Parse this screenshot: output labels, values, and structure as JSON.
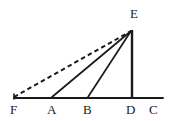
{
  "figure": {
    "background_color": "#ffffff",
    "stroke_color": "#1a1a1a",
    "label_color": "#1a1a1a",
    "width": 169,
    "height": 121
  },
  "points": {
    "F": {
      "label": "F",
      "x": 14,
      "y": 98,
      "label_x": 10,
      "label_y": 104
    },
    "A": {
      "label": "A",
      "x": 52,
      "y": 98,
      "label_x": 47,
      "label_y": 104
    },
    "B": {
      "label": "B",
      "x": 88,
      "y": 98,
      "label_x": 83,
      "label_y": 104
    },
    "D": {
      "label": "D",
      "x": 132,
      "y": 98,
      "label_x": 126,
      "label_y": 104
    },
    "C": {
      "label": "C",
      "x": 157,
      "y": 98,
      "label_x": 150,
      "label_y": 104
    },
    "E": {
      "label": "E",
      "x": 132,
      "y": 30,
      "label_x": 130,
      "label_y": 8
    }
  },
  "segments": [
    {
      "name": "baseline-FC",
      "from": "F",
      "to": "C",
      "style": "solid",
      "width": 1.6
    },
    {
      "name": "segment-DE",
      "from": "D",
      "to": "E",
      "style": "solid",
      "width": 2.2
    },
    {
      "name": "segment-BE",
      "from": "B",
      "to": "E",
      "style": "solid",
      "width": 1.6
    },
    {
      "name": "segment-AE",
      "from": "A",
      "to": "E",
      "style": "solid",
      "width": 1.6
    },
    {
      "name": "segment-FE",
      "from": "F",
      "to": "E",
      "style": "dashed",
      "width": 1.8,
      "dash": "4,3"
    }
  ],
  "labels": {
    "F": "F",
    "A": "A",
    "B": "B",
    "D": "D",
    "C": "C",
    "E": "E"
  }
}
